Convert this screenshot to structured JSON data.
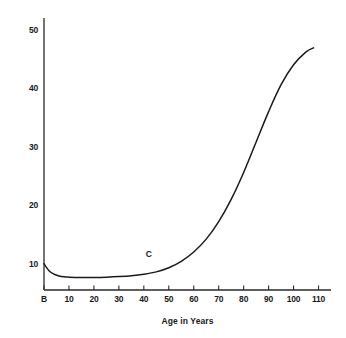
{
  "chart_data": {
    "type": "line",
    "title": "",
    "xlabel": "Age in Years",
    "ylabel": "",
    "xlim": [
      0,
      115
    ],
    "ylim": [
      5.5,
      52
    ],
    "grid": false,
    "legend": null,
    "x_tick_labels": [
      "B",
      "10",
      "20",
      "30",
      "40",
      "50",
      "60",
      "70",
      "80",
      "90",
      "100",
      "110"
    ],
    "x_tick_values": [
      0,
      10,
      20,
      30,
      40,
      50,
      60,
      70,
      80,
      90,
      100,
      110
    ],
    "y_tick_labels": [
      "10",
      "20",
      "30",
      "40",
      "50"
    ],
    "y_tick_values": [
      10,
      20,
      30,
      40,
      50
    ],
    "annotations": [
      {
        "text": "C",
        "x": 42,
        "y": 11.6
      }
    ],
    "series": [
      {
        "name": "curve-c",
        "color": "#1a1a1a",
        "x": [
          0,
          2,
          4,
          6,
          8,
          10,
          15,
          20,
          25,
          30,
          35,
          40,
          45,
          50,
          55,
          60,
          65,
          70,
          75,
          80,
          85,
          90,
          95,
          100,
          105,
          108
        ],
        "values": [
          10.0,
          8.8,
          8.2,
          7.9,
          7.75,
          7.7,
          7.65,
          7.65,
          7.7,
          7.8,
          7.95,
          8.2,
          8.6,
          9.3,
          10.4,
          12.0,
          14.2,
          17.2,
          21.0,
          25.6,
          30.8,
          36.0,
          40.6,
          44.0,
          46.2,
          46.9
        ]
      }
    ]
  },
  "geometry": {
    "plot_left": 44,
    "plot_right": 331,
    "plot_top": 18,
    "plot_bottom": 290,
    "axis_color": "#2a2a2a",
    "curve_color": "#1a1a1a",
    "background": "#ffffff"
  },
  "axis_title_x": "Age in Years"
}
